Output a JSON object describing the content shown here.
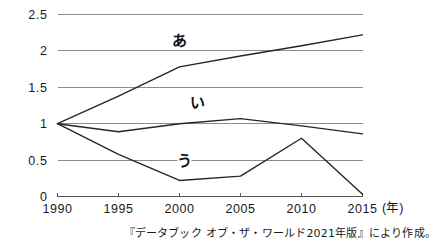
{
  "chart_data": {
    "type": "line",
    "title": "",
    "subtitle": "",
    "xlabel": "",
    "ylabel": "",
    "x": [
      1990,
      1995,
      2000,
      2005,
      2010,
      2015
    ],
    "xtick_labels": [
      "1990",
      "1995",
      "2000",
      "2005",
      "2010",
      "2015"
    ],
    "x_unit_label": "(年)",
    "ytick_labels": [
      "0",
      "0.5",
      "1",
      "1.5",
      "2",
      "2.5"
    ],
    "ytick_values": [
      0,
      0.5,
      1,
      1.5,
      2,
      2.5
    ],
    "ylim": [
      0,
      2.5
    ],
    "xlim": [
      1990,
      2015
    ],
    "grid": "horizontal",
    "legend_position": "inline-labels",
    "series": [
      {
        "name": "あ",
        "label": "あ",
        "color": "#262626",
        "values": [
          1.0,
          1.38,
          1.78,
          1.93,
          2.07,
          2.22
        ],
        "label_x": 2000,
        "label_y": 2.07
      },
      {
        "name": "い",
        "label": "い",
        "color": "#262626",
        "values": [
          1.0,
          0.89,
          1.0,
          1.07,
          0.97,
          0.86
        ],
        "label_x": 2001.5,
        "label_y": 1.22
      },
      {
        "name": "う",
        "label": "う",
        "color": "#262626",
        "values": [
          1.0,
          0.58,
          0.22,
          0.28,
          0.8,
          0.03
        ],
        "label_x": 2000.4,
        "label_y": 0.42
      }
    ],
    "annotations": []
  },
  "caption": {
    "source_note": "『データブック オブ・ザ・ワールド2021年版』により作成。"
  }
}
